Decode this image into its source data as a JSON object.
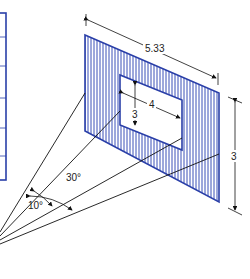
{
  "diagram": {
    "colors": {
      "frame": "#2a3fa8",
      "hatch": "#3a4fb8",
      "line": "#111111"
    },
    "labels": {
      "width_outer": "5.33",
      "height_outer": "3",
      "width_inner": "4",
      "height_inner": "3",
      "angle_outer": "30°",
      "angle_inner": "10°"
    }
  }
}
